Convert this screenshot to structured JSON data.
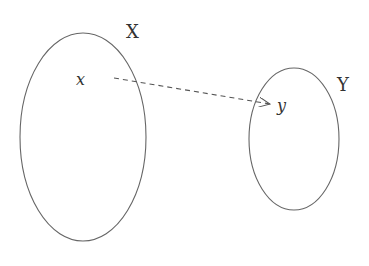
{
  "diagram": {
    "type": "mapping",
    "sets": [
      {
        "name": "X",
        "element": "x"
      },
      {
        "name": "Y",
        "element": "y"
      }
    ],
    "arrow": {
      "from": "x",
      "to": "y",
      "style": "dashed"
    },
    "colors": {
      "stroke": "#555555",
      "text": "#333333"
    }
  }
}
